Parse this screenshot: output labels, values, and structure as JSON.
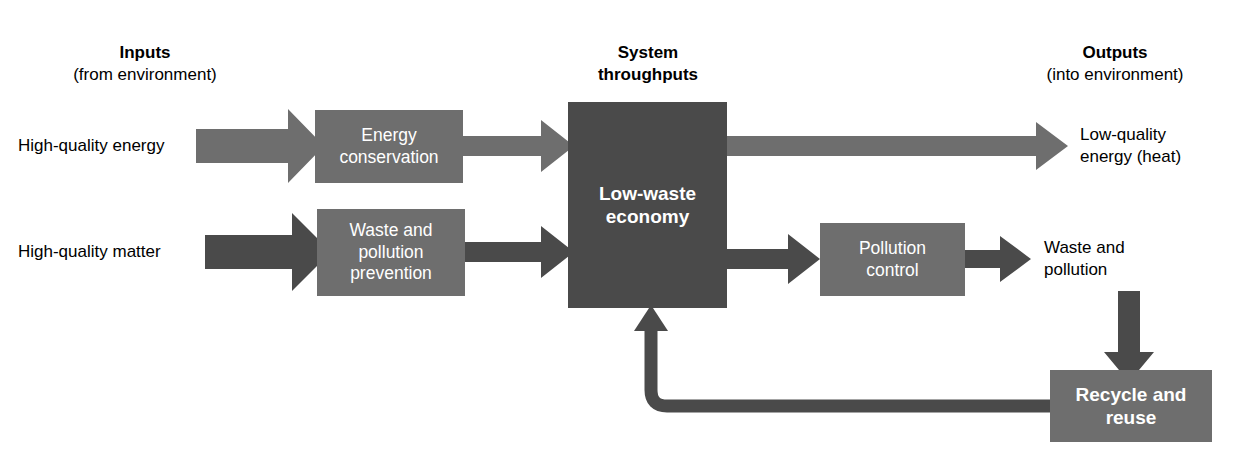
{
  "diagram": {
    "background": "#ffffff",
    "colors": {
      "arrow_light": "#6e6e6e",
      "arrow_dark": "#4a4a4a",
      "box_mid": "#6e6e6e",
      "box_core": "#4a4a4a",
      "text_dark": "#000000",
      "text_light": "#ffffff"
    }
  },
  "headers": {
    "inputs": {
      "line1": "Inputs",
      "line2": "(from environment)"
    },
    "throughputs": {
      "line1": "System",
      "line2": "throughputs"
    },
    "outputs": {
      "line1": "Outputs",
      "line2": "(into environment)"
    }
  },
  "inputs": [
    {
      "label": "High-quality energy",
      "arrow": "arrow-light"
    },
    {
      "label": "High-quality matter",
      "arrow": "arrow-dark"
    }
  ],
  "outputs": [
    {
      "line1": "Low-quality",
      "line2": "energy (heat)"
    },
    {
      "line1": "Waste and",
      "line2": "pollution"
    }
  ],
  "boxes": {
    "energy_conservation": {
      "line1": "Energy",
      "line2": "conservation"
    },
    "waste_prevention": {
      "line1": "Waste and",
      "line2": "pollution",
      "line3": "prevention"
    },
    "core": {
      "line1": "Low-waste",
      "line2": "economy"
    },
    "pollution_control": {
      "line1": "Pollution",
      "line2": "control"
    },
    "recycle": {
      "line1": "Recycle and",
      "line2": "reuse"
    }
  },
  "flows": [
    {
      "name": "energy-input-arrow",
      "from": "High-quality energy",
      "to": "Energy conservation"
    },
    {
      "name": "matter-input-arrow",
      "from": "High-quality matter",
      "to": "Waste and pollution prevention"
    },
    {
      "name": "conservation-to-core-arrow",
      "from": "Energy conservation",
      "to": "Low-waste economy"
    },
    {
      "name": "prevention-to-core-arrow",
      "from": "Waste and pollution prevention",
      "to": "Low-waste economy"
    },
    {
      "name": "core-heat-output-arrow",
      "from": "Low-waste economy",
      "to": "Low-quality energy (heat)"
    },
    {
      "name": "core-to-pollution-control-arrow",
      "from": "Low-waste economy",
      "to": "Pollution control"
    },
    {
      "name": "pollution-control-output-arrow",
      "from": "Pollution control",
      "to": "Waste and pollution"
    },
    {
      "name": "waste-to-recycle-arrow",
      "from": "Waste and pollution",
      "to": "Recycle and reuse"
    },
    {
      "name": "recycle-feedback-arrow",
      "from": "Recycle and reuse",
      "to": "Low-waste economy"
    }
  ]
}
